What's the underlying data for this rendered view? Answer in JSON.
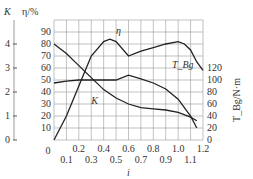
{
  "chart_data": {
    "type": "line",
    "title": "",
    "xlabel": "i",
    "ylabel_left_outer": "K",
    "ylabel_left": "η/%",
    "ylabel_right": "T_Bg/N·m",
    "x_ticks_top": [
      "0",
      "0.2",
      "0.4",
      "0.6",
      "0.8",
      "1.0",
      "1.2"
    ],
    "x_ticks_bottom": [
      "0.1",
      "0.3",
      "0.5",
      "0.7",
      "0.9",
      "1.1"
    ],
    "eta_ticks": [
      "10",
      "20",
      "30",
      "40",
      "50",
      "60",
      "70",
      "80",
      "90"
    ],
    "k_ticks": [
      "0",
      "1",
      "2",
      "3",
      "4"
    ],
    "t_ticks": [
      "0",
      "20",
      "40",
      "60",
      "80",
      "100",
      "120"
    ],
    "xlim": [
      0,
      1.2
    ],
    "series": [
      {
        "name": "η",
        "axis": "η/%",
        "x": [
          0,
          0.1,
          0.2,
          0.3,
          0.4,
          0.45,
          0.5,
          0.6,
          0.7,
          0.8,
          0.9,
          1.0,
          1.05,
          1.1,
          1.15,
          1.2
        ],
        "values": [
          0,
          20,
          45,
          70,
          82,
          84,
          82,
          70,
          74,
          77,
          80,
          82,
          80,
          75,
          65,
          58
        ]
      },
      {
        "name": "T_Bg",
        "axis": "T_Bg/N·m",
        "x": [
          0,
          0.1,
          0.2,
          0.3,
          0.4,
          0.5,
          0.6,
          0.7,
          0.8,
          0.9,
          1.0,
          1.1,
          1.15
        ],
        "values": [
          95,
          98,
          100,
          100,
          100,
          100,
          108,
          102,
          95,
          85,
          68,
          40,
          20
        ]
      },
      {
        "name": "K",
        "axis": "K",
        "x": [
          0,
          0.1,
          0.2,
          0.3,
          0.4,
          0.5,
          0.6,
          0.7,
          0.8,
          0.9,
          1.0,
          1.1,
          1.15
        ],
        "values": [
          4.0,
          3.6,
          3.1,
          2.6,
          2.1,
          1.75,
          1.5,
          1.35,
          1.3,
          1.25,
          1.15,
          0.95,
          0.8
        ]
      }
    ],
    "grid": true
  }
}
